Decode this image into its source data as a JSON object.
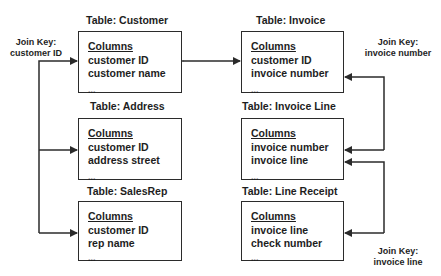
{
  "tables": [
    {
      "title": "Table: Customer",
      "header": "Columns",
      "columns": [
        "customer ID",
        "customer name"
      ],
      "more": "..."
    },
    {
      "title": "Table: Address",
      "header": "Columns",
      "columns": [
        "customer ID",
        "address street"
      ],
      "more": "..."
    },
    {
      "title": "Table: SalesRep",
      "header": "Columns",
      "columns": [
        "customer ID",
        "rep name"
      ],
      "more": "..."
    },
    {
      "title": "Table: Invoice",
      "header": "Columns",
      "columns": [
        "customer ID",
        "invoice number"
      ],
      "more": "..."
    },
    {
      "title": "Table: Invoice Line",
      "header": "Columns",
      "columns": [
        "invoice number",
        "invoice line"
      ],
      "more": "..."
    },
    {
      "title": "Table: Line Receipt",
      "header": "Columns",
      "columns": [
        "invoice line",
        "check number"
      ],
      "more": "..."
    }
  ],
  "join_keys": [
    {
      "label": "Join Key:",
      "key": "customer ID"
    },
    {
      "label": "Join Key:",
      "key": "invoice number"
    },
    {
      "label": "Join Key:",
      "key": "invoice line"
    }
  ],
  "relationships": [
    {
      "from": "Customer",
      "to": "Address",
      "key": "customer ID"
    },
    {
      "from": "Customer",
      "to": "SalesRep",
      "key": "customer ID"
    },
    {
      "from": "Customer",
      "to": "Invoice",
      "key": "customer ID",
      "bidirectional": true
    },
    {
      "from": "Invoice",
      "to": "Invoice Line",
      "key": "invoice number"
    },
    {
      "from": "Invoice Line",
      "to": "Line Receipt",
      "key": "invoice line"
    }
  ],
  "colors": {
    "line": "#2b2b2b",
    "text": "#1e1e1e",
    "background": "#ffffff"
  }
}
